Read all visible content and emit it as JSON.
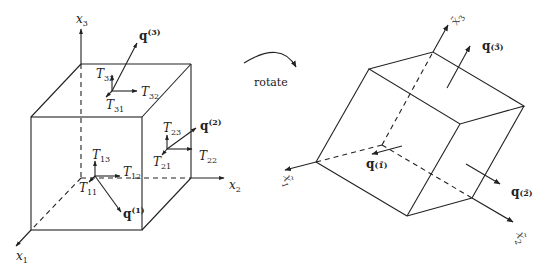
{
  "left_figure": {
    "axes": {
      "x1": {
        "base": "x",
        "sub": "1"
      },
      "x2": {
        "base": "x",
        "sub": "2"
      },
      "x3": {
        "base": "x",
        "sub": "3"
      }
    },
    "traction_vectors": {
      "q1": {
        "base": "q",
        "sup": "(1)"
      },
      "q2": {
        "base": "q",
        "sup": "(2)"
      },
      "q3": {
        "base": "q",
        "sup": "(3)"
      }
    },
    "stress_components": {
      "T11": {
        "base": "T",
        "sub": "11"
      },
      "T12": {
        "base": "T",
        "sub": "12"
      },
      "T13": {
        "base": "T",
        "sub": "13"
      },
      "T21": {
        "base": "T",
        "sub": "21"
      },
      "T22": {
        "base": "T",
        "sub": "22"
      },
      "T23": {
        "base": "T",
        "sub": "23"
      },
      "T31": {
        "base": "T",
        "sub": "31"
      },
      "T32": {
        "base": "T",
        "sub": "32"
      },
      "T33": {
        "base": "T",
        "sub": "33"
      }
    }
  },
  "transition": {
    "label": "rotate"
  },
  "right_figure": {
    "axes": {
      "x1": {
        "base": "x̃",
        "sub": "1"
      },
      "x2": {
        "base": "x̃",
        "sub": "2"
      },
      "x3": {
        "base": "x̃",
        "sub": "3"
      }
    },
    "traction_vectors": {
      "q1": {
        "base": "q",
        "sup": "(1̃)"
      },
      "q2": {
        "base": "q",
        "sup": "(2̃)"
      },
      "q3": {
        "base": "q",
        "sup": "(3̃)"
      }
    }
  },
  "colors": {
    "stroke": "#222222",
    "background": "#ffffff"
  }
}
